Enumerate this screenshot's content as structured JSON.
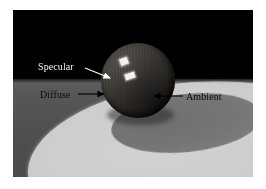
{
  "figure": {
    "frame": {
      "x": 13,
      "y": 10,
      "width": 240,
      "height": 167
    },
    "background_color": "#ffffff"
  },
  "scene": {
    "backdrop_color": "#000000",
    "ground_color": "#565656",
    "light_pool_color": "#c8c8c8",
    "cast_shadow_color": "#787878",
    "sphere_base_color": "#3a3733",
    "specular_color": "#f2f2f0",
    "objects": [
      {
        "name": "sphere",
        "description": "dark shaded sphere resting on the ground plane"
      },
      {
        "name": "ground-plane",
        "description": "gray floor receding to a horizon"
      },
      {
        "name": "light-pool",
        "description": "bright elliptical pool of light on the floor"
      },
      {
        "name": "cast-shadow",
        "description": "elliptical shadow cast by the sphere"
      },
      {
        "name": "specular-highlight-upper",
        "description": "small bright rectangular highlight"
      },
      {
        "name": "specular-highlight-lower",
        "description": "small bright rectangular highlight"
      }
    ]
  },
  "annotations": [
    {
      "id": "specular",
      "label": "Specular",
      "text_color": "#f0f0f0",
      "arrow_color": "#ffffff",
      "points_at": "specular-highlight-upper",
      "arrow": {
        "x1": 85,
        "y1": 68,
        "x2": 112,
        "y2": 79
      }
    },
    {
      "id": "diffuse",
      "label": "Diffuse",
      "text_color": "#0b0b0b",
      "arrow_color": "#000000",
      "points_at": "sphere-lit-surface",
      "arrow": {
        "x1": 78,
        "y1": 94,
        "x2": 106,
        "y2": 94
      }
    },
    {
      "id": "ambient",
      "label": "Ambient",
      "text_color": "#0b0b0b",
      "arrow_color": "#000000",
      "points_at": "sphere-shadow-side",
      "arrow": {
        "x1": 183,
        "y1": 96,
        "x2": 152,
        "y2": 96
      }
    }
  ]
}
